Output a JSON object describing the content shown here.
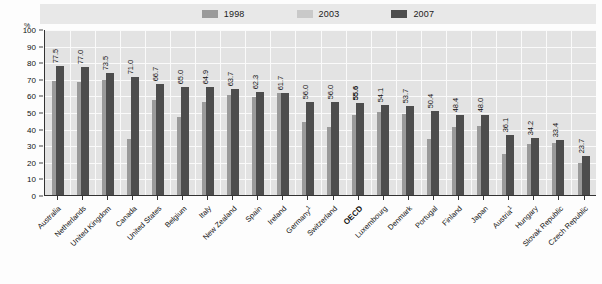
{
  "unit": "%",
  "legend": {
    "items": [
      {
        "label": "1998",
        "color": "#9a9a9a",
        "name": "legend-1998"
      },
      {
        "label": "2003",
        "color": "#c9c9c9",
        "name": "legend-2003"
      },
      {
        "label": "2007",
        "color": "#4d4d4d",
        "name": "legend-2007"
      }
    ]
  },
  "chart_data": {
    "type": "bar",
    "title": "",
    "subtitle": "",
    "xlabel": "",
    "ylabel": "%",
    "ylim": [
      0,
      100
    ],
    "yticks": [
      0,
      10,
      20,
      30,
      40,
      50,
      60,
      70,
      80,
      90,
      100
    ],
    "grid": true,
    "legend_position": "top-center",
    "value_label_series": "2007",
    "highlight_category": "OECD",
    "categories": [
      "Australia",
      "Netherlands",
      "United Kingdom",
      "Canada",
      "United States",
      "Belgium",
      "Italy",
      "New Zealand",
      "Spain",
      "Ireland",
      "Germany",
      "Switzerland",
      "OECD",
      "Luxembourg",
      "Denmark",
      "Portugal",
      "Finland",
      "Japan",
      "Austria",
      "Hungary",
      "Slovak Republic",
      "Czech Republic"
    ],
    "category_footnotes": {
      "Germany": "1",
      "Austria": "1"
    },
    "series": [
      {
        "name": "1998",
        "color": "#9a9a9a",
        "values": [
          68.5,
          68.0,
          69.5,
          33.5,
          57.0,
          47.0,
          56.0,
          60.5,
          59.0,
          61.5,
          44.0,
          41.0,
          48.0,
          50.0,
          49.0,
          33.5,
          41.0,
          41.5,
          25.0,
          31.0,
          31.5,
          19.0
        ]
      },
      {
        "name": "2003",
        "color": "#c9c9c9",
        "values": [
          null,
          null,
          null,
          null,
          null,
          null,
          null,
          null,
          null,
          null,
          null,
          null,
          null,
          null,
          null,
          null,
          null,
          null,
          null,
          null,
          null,
          null
        ]
      },
      {
        "name": "2007",
        "color": "#4d4d4d",
        "values": [
          77.5,
          77.0,
          73.5,
          71.0,
          66.7,
          65.0,
          64.9,
          63.7,
          62.3,
          61.7,
          56.0,
          56.0,
          55.6,
          54.1,
          53.7,
          50.4,
          48.4,
          48.0,
          36.1,
          34.2,
          33.4,
          23.7
        ]
      }
    ],
    "value_labels": [
      "77.5",
      "77.0",
      "73.5",
      "71.0",
      "66.7",
      "65.0",
      "64.9",
      "63.7",
      "62.3",
      "61.7",
      "56.0",
      "56.0",
      "55.6",
      "54.1",
      "53.7",
      "50.4",
      "48.4",
      "48.0",
      "36.1",
      "34.2",
      "33.4",
      "23.7"
    ]
  }
}
